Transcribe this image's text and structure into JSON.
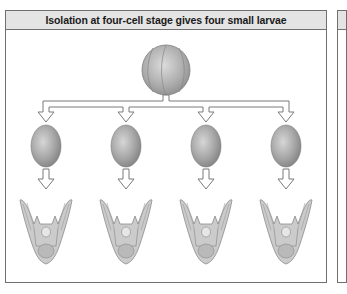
{
  "panel": {
    "title": "Isolation at four-cell stage gives four small larvae"
  },
  "diagram": {
    "source": {
      "label": "four-cell-embryo",
      "cells": 4
    },
    "branches": [
      {
        "index": 1,
        "cell": "isolated-blastomere",
        "result": "small-larva"
      },
      {
        "index": 2,
        "cell": "isolated-blastomere",
        "result": "small-larva"
      },
      {
        "index": 3,
        "cell": "isolated-blastomere",
        "result": "small-larva"
      },
      {
        "index": 4,
        "cell": "isolated-blastomere",
        "result": "small-larva"
      }
    ],
    "colors": {
      "cell_fill": "#9a9a9a",
      "cell_highlight": "#d2d2d2",
      "arrow_fill": "#ffffff",
      "arrow_stroke": "#7a7a7a",
      "larva_fill": "#c8c8c8",
      "larva_stroke": "#8a8a8a",
      "header_bg": "#e4e4e4",
      "border": "#6f6f6f"
    }
  }
}
